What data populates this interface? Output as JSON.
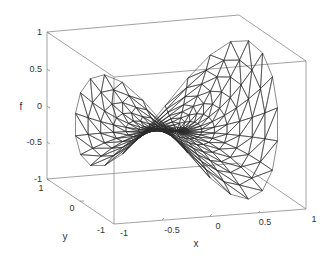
{
  "chart_data": {
    "type": "mesh3d",
    "title": "",
    "xlabel": "x",
    "ylabel": "y",
    "zlabel": "f",
    "xlim": [
      -1,
      1
    ],
    "ylim": [
      -1,
      1
    ],
    "zlim": [
      -1,
      1
    ],
    "x_ticks": [
      "-1",
      "-0.5",
      "0",
      "0.5",
      "1"
    ],
    "y_ticks": [
      "-1",
      "0",
      "1"
    ],
    "z_ticks": [
      "-1",
      "-0.5",
      "0",
      "0.5",
      "1"
    ],
    "grid": false,
    "box": true,
    "surface_extent": {
      "f_min": -0.85,
      "f_max": 0.8
    }
  },
  "axes": {
    "z_tick_labels": [
      "1",
      "0.5",
      "0",
      "-0.5",
      "-1"
    ],
    "y_tick_labels": [
      "1",
      "0",
      "-1"
    ],
    "x_tick_labels": [
      "-1",
      "-0.5",
      "0",
      "0.5",
      "1"
    ],
    "xlabel": "x",
    "ylabel": "y",
    "zlabel": "f"
  },
  "colors": {
    "box": "#8a8a8a",
    "mesh": "#2a2a2a",
    "text": "#333333"
  }
}
